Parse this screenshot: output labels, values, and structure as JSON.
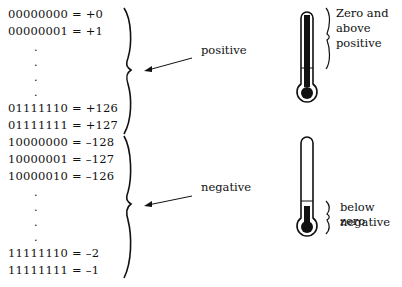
{
  "positive_rows": [
    {
      "bits": "00000000",
      "value": "+0"
    },
    {
      "bits": "00000001",
      "value": "+1"
    },
    {
      "bits": "01111110",
      "value": "+126"
    },
    {
      "bits": "01111111",
      "value": "+127"
    }
  ],
  "negative_rows": [
    {
      "bits": "10000000",
      "value": "–128"
    },
    {
      "bits": "10000001",
      "value": "–127"
    },
    {
      "bits": "10000010",
      "value": "–126"
    },
    {
      "bits": "11111110",
      "value": "–2"
    },
    {
      "bits": "11111111",
      "value": "–1"
    }
  ],
  "ellipsis": ".",
  "labels": {
    "positive": "positive",
    "negative": "negative",
    "top_thermo_line1": "Zero and",
    "top_thermo_line2": "above",
    "top_thermo_line3": "positive",
    "bottom_thermo_line1": "below zero",
    "bottom_thermo_line2": "negative"
  }
}
